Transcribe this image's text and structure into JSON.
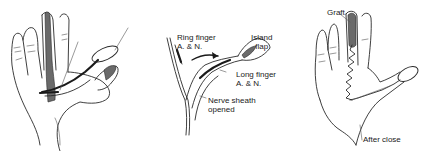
{
  "figure": {
    "panels": [
      {
        "id": "flap-elevation",
        "description": "Palm view with island flap raised from long finger, vascular pedicle dissected toward thumb",
        "labels": []
      },
      {
        "id": "pedicle-detail",
        "description": "Detail of neurovascular pedicle dissection",
        "labels": [
          {
            "text_line1": "Ring finger",
            "text_line2": "A. & N."
          },
          {
            "text_line1": "Island",
            "text_line2": "flap"
          },
          {
            "text_line1": "Long finger",
            "text_line2": "A. & N."
          },
          {
            "text_line1": "Nerve sheath",
            "text_line2": "opened"
          }
        ]
      },
      {
        "id": "after-closure",
        "description": "Palm after flap transfer to thumb and donor site grafting",
        "labels": [
          {
            "text_line1": "Graft"
          },
          {
            "text_line1": "After close"
          }
        ]
      }
    ],
    "colors": {
      "ink": "#2a2a2a",
      "background": "#ffffff"
    }
  }
}
